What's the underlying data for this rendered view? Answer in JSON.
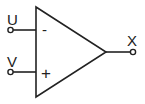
{
  "diagram": {
    "type": "op-amp symbol",
    "inputs": [
      {
        "name": "U",
        "polarity_symbol": "-",
        "polarity": "inverting"
      },
      {
        "name": "V",
        "polarity_symbol": "+",
        "polarity": "non-inverting"
      }
    ],
    "output": {
      "name": "X"
    },
    "colors": {
      "stroke": "#222222",
      "background": "#ffffff"
    }
  }
}
